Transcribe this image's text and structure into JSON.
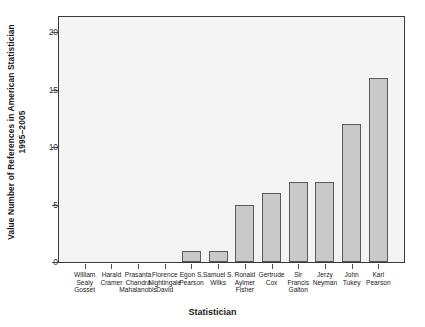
{
  "chart_data": {
    "type": "bar",
    "title": "",
    "xlabel": "Statistician",
    "ylabel": "Value Number of References in American Statistician 1995–2005",
    "ylabel_line1": "Value Number of References in American Statistician",
    "ylabel_line2": "1995–2005",
    "categories": [
      "William Sealy Gosset",
      "Harald Cramer",
      "Prasanta Chandra Mahalanobis",
      "Florence Nightingale David",
      "Egon S. Pearson",
      "Samuel S. Wilks",
      "Ronald Aylmer Fisher",
      "Gertrude Cox",
      "Sir Francis Galton",
      "Jerzy Neyman",
      "John Tukey",
      "Karl Pearson"
    ],
    "category_lines": [
      [
        "William",
        "Sealy",
        "Gosset"
      ],
      [
        "Harald",
        "Cramer"
      ],
      [
        "Prasanta",
        "Chandra",
        "Mahalanobis"
      ],
      [
        "Florence",
        "Nightingale",
        "David"
      ],
      [
        "Egon S.",
        "Pearson"
      ],
      [
        "Samuel S.",
        "Wilks"
      ],
      [
        "Ronald",
        "Aylmer",
        "Fisher"
      ],
      [
        "Gertrude",
        "Cox"
      ],
      [
        "Sir",
        "Francis",
        "Galton"
      ],
      [
        "Jerzy",
        "Neyman"
      ],
      [
        "John",
        "Tukey"
      ],
      [
        "Karl",
        "Pearson"
      ]
    ],
    "values": [
      0,
      0,
      0,
      0,
      1,
      1,
      5,
      6,
      7,
      7,
      12,
      16
    ],
    "ylim": [
      0,
      21.4
    ],
    "yticks": [
      0,
      5,
      10,
      15,
      20
    ],
    "ytick_labels": [
      "0",
      "5",
      "10",
      "15",
      "20"
    ],
    "grid": false,
    "legend": null,
    "bar_fill": "#c9c9c9",
    "bar_edge": "#5a5a5a",
    "plot_bg": "#f4f4f4",
    "frame_color": "#3a3a3a"
  }
}
